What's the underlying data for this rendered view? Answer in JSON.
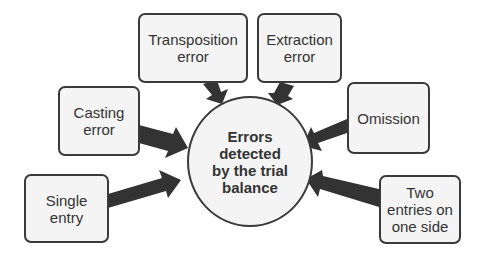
{
  "diagram": {
    "center": {
      "label": "Errors\ndetected\nby the trial\nbalance"
    },
    "nodes": [
      {
        "id": "transposition",
        "label": "Transposition\nerror"
      },
      {
        "id": "extraction",
        "label": "Extraction\nerror"
      },
      {
        "id": "casting",
        "label": "Casting\nerror"
      },
      {
        "id": "omission",
        "label": "Omission"
      },
      {
        "id": "single",
        "label": "Single\nentry"
      },
      {
        "id": "two-entries",
        "label": "Two\nentries on\none side"
      }
    ],
    "colors": {
      "arrow": "#333333",
      "border": "#3a3a3a",
      "fill": "#f4f4f4",
      "text": "#333333"
    }
  }
}
